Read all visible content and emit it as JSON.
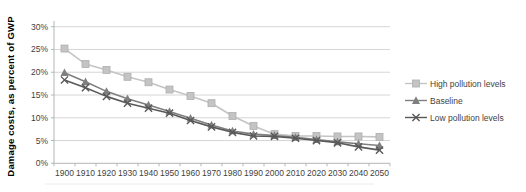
{
  "chart_data": {
    "type": "line",
    "title": "",
    "xlabel": "",
    "ylabel": "Damage costs, as percent of GWP",
    "categories": [
      "1900",
      "1910",
      "1920",
      "1930",
      "1940",
      "1950",
      "1960",
      "1970",
      "1980",
      "1990",
      "2000",
      "2010",
      "2020",
      "2030",
      "2040",
      "2050"
    ],
    "y_axis": {
      "min": 0,
      "max": 30,
      "step": 5,
      "format": "percent",
      "tick_labels": [
        "0%",
        "5%",
        "10%",
        "15%",
        "20%",
        "25%",
        "30%"
      ]
    },
    "grid": true,
    "legend_position": "right",
    "series": [
      {
        "name": "High pollution levels",
        "marker": "square",
        "color": "#c4c4c4",
        "line_color": "#c4c4c4",
        "values": [
          25.2,
          21.8,
          20.5,
          19.0,
          17.8,
          16.2,
          14.8,
          13.2,
          10.4,
          8.2,
          6.4,
          6.0,
          6.0,
          5.9,
          5.9,
          5.8
        ]
      },
      {
        "name": "Baseline",
        "marker": "triangle",
        "color": "#7f7f7f",
        "line_color": "#7f7f7f",
        "values": [
          19.9,
          17.9,
          15.8,
          14.2,
          12.8,
          11.4,
          9.9,
          8.4,
          7.1,
          6.4,
          6.1,
          5.7,
          5.2,
          4.7,
          4.3,
          3.9
        ]
      },
      {
        "name": "Low pollution levels",
        "marker": "x",
        "color": "#595959",
        "line_color": "#595959",
        "values": [
          18.3,
          16.6,
          14.7,
          13.2,
          12.1,
          11.0,
          9.4,
          8.0,
          6.8,
          6.0,
          5.9,
          5.5,
          5.0,
          4.5,
          3.6,
          2.9
        ]
      }
    ]
  },
  "colors": {
    "gridline": "#d6d6d6",
    "axis": "#b5b5b5",
    "tick_text": "#3f3f3f",
    "bottom_rule": "#ececec"
  }
}
